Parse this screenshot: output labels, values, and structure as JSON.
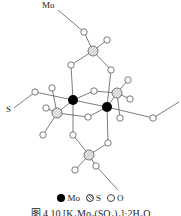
{
  "labels": {
    "top_mo": "Mo",
    "left_s": "S"
  },
  "legend": [
    {
      "symbol": "filled-black-circle",
      "label": "Mo"
    },
    {
      "symbol": "hatched-circle",
      "label": "S"
    },
    {
      "symbol": "open-circle",
      "label": "O"
    }
  ],
  "caption": "图 4.10 [K₄Mo₂(SO₄)₄]·2H₂O",
  "colors": {
    "mo": "#000000",
    "s_hatch": "#777777",
    "o_fill": "#ffffff",
    "bond": "#444444"
  }
}
